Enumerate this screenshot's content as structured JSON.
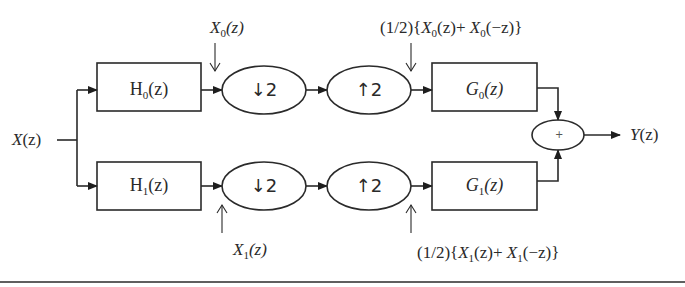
{
  "diagram": {
    "type": "two-channel filter bank block diagram",
    "input": {
      "label": "X",
      "arg": "(z)"
    },
    "output": {
      "label": "Y",
      "arg": "(z)"
    },
    "analysis_filters": [
      {
        "name": "H",
        "sub": "0",
        "arg": "(z)"
      },
      {
        "name": "H",
        "sub": "1",
        "arg": "(z)"
      }
    ],
    "downsamplers": [
      {
        "label": "↓2"
      },
      {
        "label": "↓2"
      }
    ],
    "upsamplers": [
      {
        "label": "↑2"
      },
      {
        "label": "↑2"
      }
    ],
    "synthesis_filters": [
      {
        "name": "G",
        "sub": "0",
        "arg": "(z)"
      },
      {
        "name": "G",
        "sub": "1",
        "arg": "(z)"
      }
    ],
    "adder": {
      "symbol": "+"
    },
    "annotations": {
      "x0": {
        "name": "X",
        "sub": "0",
        "arg": "(z)"
      },
      "x1": {
        "name": "X",
        "sub": "1",
        "arg": "(z)"
      },
      "top_upsampled": {
        "prefix": "(1/2){",
        "a": "X",
        "a_sub": "0",
        "a_arg": "(z)+ ",
        "b": "X",
        "b_sub": "0",
        "b_arg": "(−z)}"
      },
      "bottom_upsampled": {
        "prefix": "(1/2){",
        "a": "X",
        "a_sub": "1",
        "a_arg": "(z)+ ",
        "b": "X",
        "b_sub": "1",
        "b_arg": "(−z)}"
      }
    },
    "colors": {
      "stroke": "#2a2a2a",
      "background": "#ffffff"
    }
  }
}
